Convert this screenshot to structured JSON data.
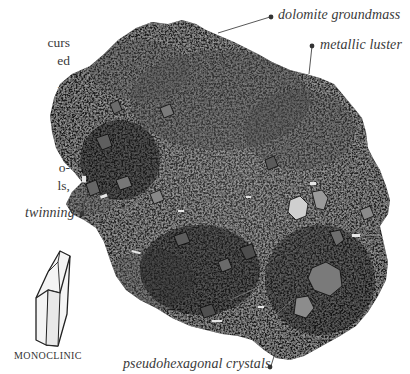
{
  "page": {
    "type": "mineral-specimen-reference"
  },
  "body_text": {
    "lines": [
      {
        "text": "curs",
        "top": 46
      },
      {
        "text": "ed",
        "top": 64
      },
      {
        "text": "ls,",
        "top": 94
      },
      {
        "text": "oth",
        "top": 112
      },
      {
        "text": "y.",
        "top": 130
      },
      {
        "text": "o-",
        "top": 169
      },
      {
        "text": "ls,",
        "top": 187
      }
    ]
  },
  "annotations": [
    {
      "id": "dolomite-groundmass",
      "label": "dolomite groundmass"
    },
    {
      "id": "metallic-luster",
      "label": "metallic luster"
    },
    {
      "id": "twinning",
      "label": "twinning"
    },
    {
      "id": "pseudohexagonal-crystals",
      "label": "pseudohexagonal crystals"
    }
  ],
  "crystal_diagram": {
    "caption": "MONOCLINIC",
    "shape": "monoclinic-prism"
  },
  "colors": {
    "background": "#ffffff",
    "rock_dark": "#141414",
    "rock_mid": "#2e2e2e",
    "rock_light": "#6b6b6b",
    "label_text": "#3a3a3a",
    "leader_line": "#444444"
  }
}
